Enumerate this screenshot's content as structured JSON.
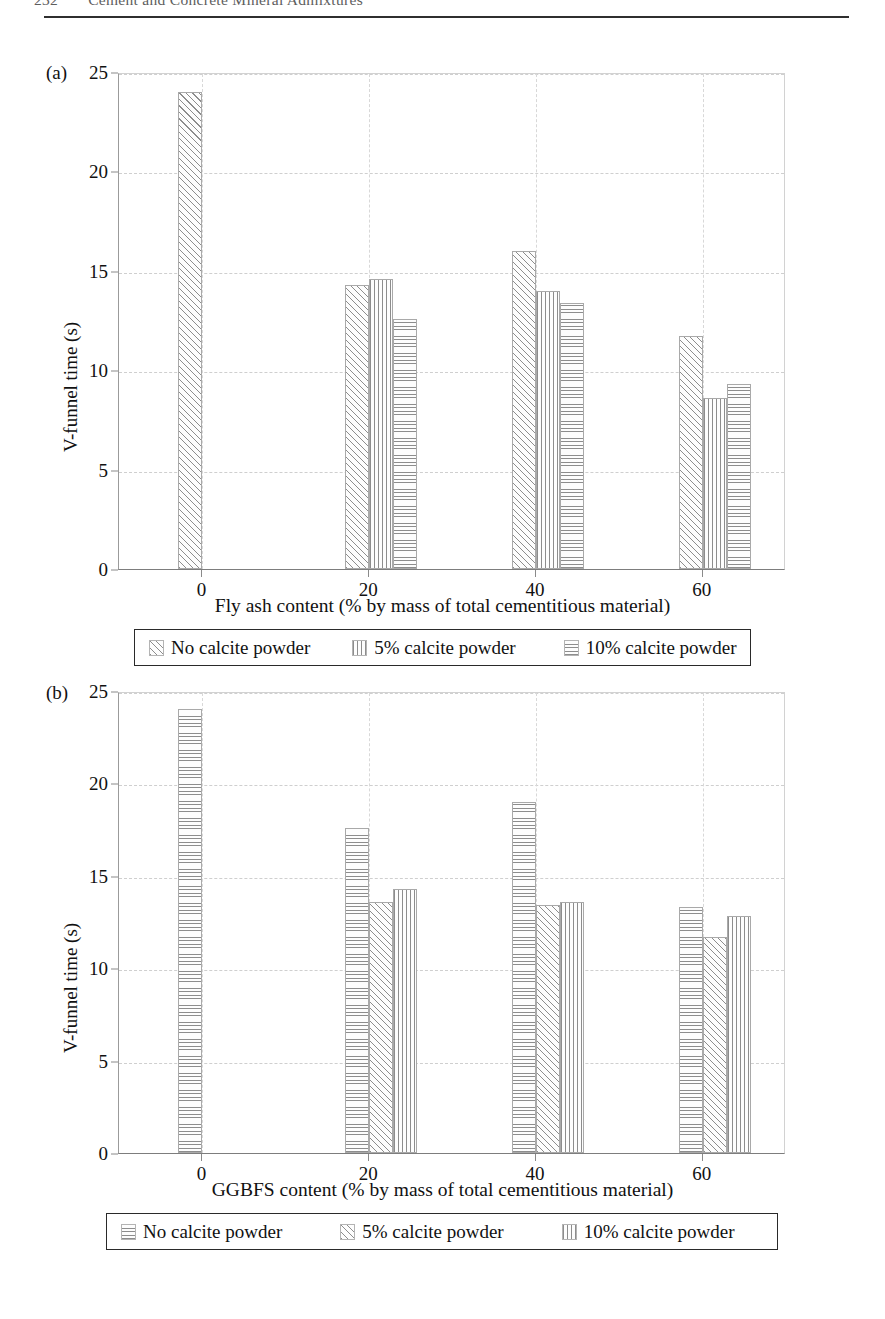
{
  "page": {
    "number": "232",
    "running_title": "Cement and Concrete Mineral Admixtures"
  },
  "figures": [
    {
      "panel_tag": "(a)",
      "chart_data": {
        "type": "bar",
        "title": "",
        "xlabel": "Fly ash content (% by mass of total cementitious material)",
        "ylabel": "V-funnel time (s)",
        "categories": [
          "0",
          "20",
          "40",
          "60"
        ],
        "xlim": [
          -10,
          70
        ],
        "ylim": [
          0,
          25
        ],
        "yticks": [
          "0",
          "5",
          "10",
          "15",
          "20",
          "25"
        ],
        "grid": true,
        "legend_position": "below",
        "series": [
          {
            "name": "No calcite powder",
            "pattern": "diagonal",
            "values": [
              24.0,
              14.3,
              16.0,
              11.7
            ]
          },
          {
            "name": "5% calcite powder",
            "pattern": "vertical",
            "values": [
              null,
              14.6,
              14.0,
              8.6
            ]
          },
          {
            "name": "10% calcite powder",
            "pattern": "horizontal",
            "values": [
              null,
              12.6,
              13.4,
              9.3
            ]
          }
        ]
      }
    },
    {
      "panel_tag": "(b)",
      "chart_data": {
        "type": "bar",
        "title": "",
        "xlabel": "GGBFS content (% by mass of total cementitious material)",
        "ylabel": "V-funnel time (s)",
        "categories": [
          "0",
          "20",
          "40",
          "60"
        ],
        "xlim": [
          -10,
          70
        ],
        "ylim": [
          0,
          25
        ],
        "yticks": [
          "0",
          "5",
          "10",
          "15",
          "20",
          "25"
        ],
        "grid": true,
        "legend_position": "below",
        "series": [
          {
            "name": "No calcite powder",
            "pattern": "horizontal",
            "values": [
              24.0,
              17.6,
              19.0,
              13.3
            ]
          },
          {
            "name": "5% calcite powder",
            "pattern": "diagonal",
            "values": [
              null,
              13.6,
              13.4,
              11.7
            ]
          },
          {
            "name": "10% calcite powder",
            "pattern": "vertical",
            "values": [
              null,
              14.3,
              13.6,
              12.8
            ]
          }
        ]
      }
    }
  ]
}
